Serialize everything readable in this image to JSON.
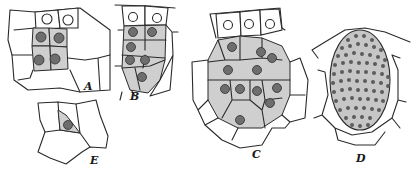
{
  "figure": {
    "panels": [
      {
        "id": "A",
        "label": "A"
      },
      {
        "id": "B",
        "label": "B"
      },
      {
        "id": "C",
        "label": "C"
      },
      {
        "id": "D",
        "label": "D"
      },
      {
        "id": "E",
        "label": "E"
      }
    ],
    "colors": {
      "line": "#2a2a2a",
      "shading": "#cfcfcf",
      "nucleus": "#6e6e6e",
      "background": "#ffffff"
    }
  }
}
